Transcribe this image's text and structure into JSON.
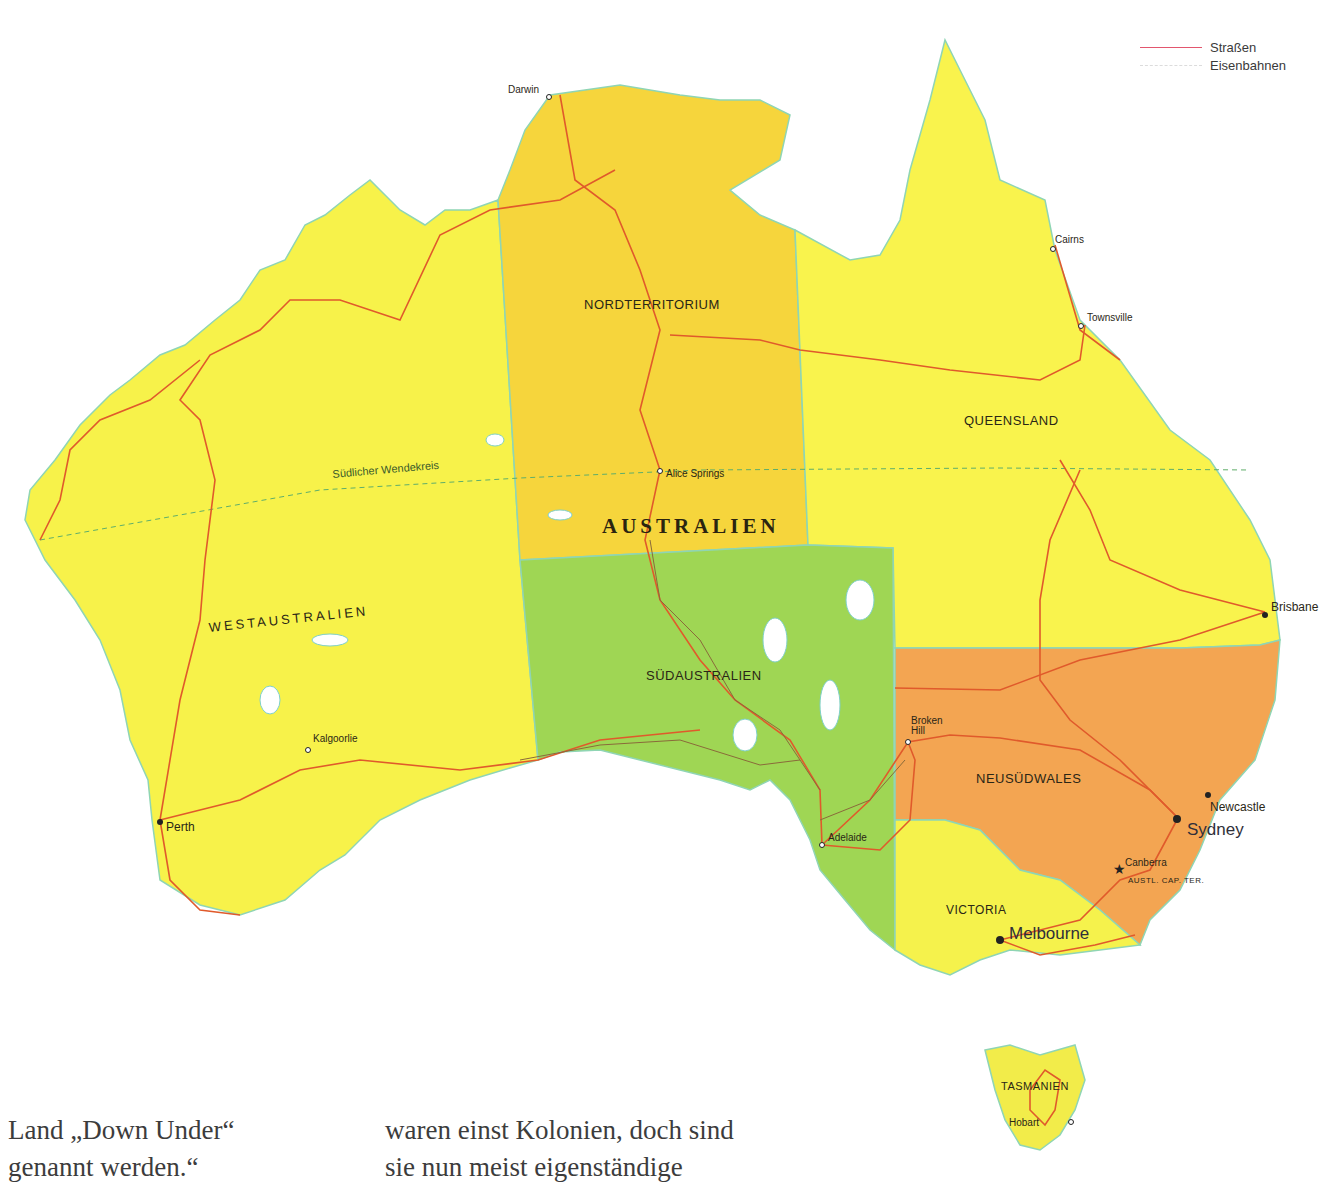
{
  "legend": {
    "items": [
      {
        "label": "Straßen",
        "color": "#e2566e",
        "style": "solid"
      },
      {
        "label": "Eisenbahnen",
        "color": "#dcdcdc",
        "style": "dashed"
      }
    ]
  },
  "map": {
    "country_label": "AUSTRALIEN",
    "tropic_label": "Südlicher Wendekreis",
    "colors": {
      "western_australia": "#f7f24a",
      "northern_territory": "#f6d53c",
      "queensland": "#f9f34d",
      "south_australia": "#9fd654",
      "new_south_wales": "#f3a552",
      "victoria": "#f5f24c",
      "tasmania": "#f2ec4a",
      "roads": "#e05a2b",
      "railways": "#8a6a3a",
      "water_outline": "#7fd0c8",
      "background": "#ffffff"
    },
    "states": [
      {
        "name": "WESTAUSTRALIEN"
      },
      {
        "name": "NORDTERRITORIUM"
      },
      {
        "name": "QUEENSLAND"
      },
      {
        "name": "SÜDAUSTRALIEN"
      },
      {
        "name": "NEUSÜDWALES"
      },
      {
        "name": "VICTORIA"
      },
      {
        "name": "TASMANIEN"
      },
      {
        "name": "AUSTL. CAP. TER."
      }
    ],
    "cities": [
      {
        "name": "Darwin"
      },
      {
        "name": "Cairns"
      },
      {
        "name": "Townsville"
      },
      {
        "name": "Alice Springs"
      },
      {
        "name": "Brisbane"
      },
      {
        "name": "Broken Hill"
      },
      {
        "name": "Kalgoorlie"
      },
      {
        "name": "Perth"
      },
      {
        "name": "Adelaide"
      },
      {
        "name": "Newcastle"
      },
      {
        "name": "Sydney"
      },
      {
        "name": "Canberra"
      },
      {
        "name": "Melbourne"
      },
      {
        "name": "Hobart"
      }
    ]
  },
  "text": {
    "left_column_line1": "Land „Down Under“",
    "left_column_line2": "genannt werden.“",
    "right_column_line1": "waren einst Kolonien, doch sind",
    "right_column_line2": "sie nun meist eigenständige"
  }
}
